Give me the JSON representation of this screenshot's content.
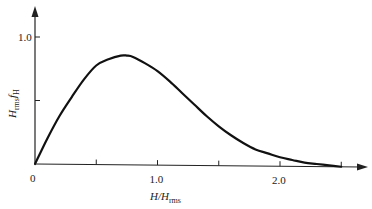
{
  "chart_data": {
    "type": "line",
    "title": "",
    "xlabel": "H/H_rms",
    "ylabel": "H_rms f_H",
    "xlabel_parts": {
      "main": "H/H",
      "sub": "rms"
    },
    "ylabel_parts": {
      "main": "H",
      "sub1": "rms",
      "mid": "f",
      "sub2": "H"
    },
    "x_ticks": [
      0,
      0.5,
      1.0,
      1.5,
      2.0,
      2.5
    ],
    "x_tick_labels": [
      "0",
      "",
      "1.0",
      "",
      "2.0",
      ""
    ],
    "y_ticks": [
      0,
      0.5,
      1.0
    ],
    "y_tick_labels": [
      "",
      "",
      "1.0"
    ],
    "xlim": [
      0,
      2.7
    ],
    "ylim": [
      0,
      1.2
    ],
    "grid": false,
    "legend": null,
    "series": [
      {
        "name": "Rayleigh distribution",
        "x": [
          0,
          0.1,
          0.2,
          0.3,
          0.4,
          0.5,
          0.6,
          0.7,
          0.75,
          0.8,
          0.9,
          1.0,
          1.1,
          1.2,
          1.3,
          1.4,
          1.5,
          1.6,
          1.7,
          1.8,
          1.9,
          2.0,
          2.1,
          2.2,
          2.3,
          2.4,
          2.5
        ],
        "values": [
          0,
          0.2,
          0.38,
          0.53,
          0.67,
          0.78,
          0.83,
          0.86,
          0.86,
          0.85,
          0.8,
          0.74,
          0.66,
          0.57,
          0.48,
          0.39,
          0.31,
          0.24,
          0.18,
          0.13,
          0.1,
          0.07,
          0.05,
          0.03,
          0.02,
          0.01,
          0.0
        ]
      }
    ]
  },
  "origin_label": "0"
}
